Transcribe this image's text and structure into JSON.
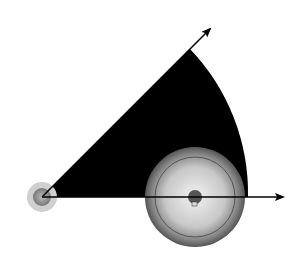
{
  "diagram": {
    "angle_label": "45°",
    "components": {
      "small_sprocket": "drive sprocket",
      "large_sprocket": "driven sprocket",
      "chain": "roller chain",
      "sector": "permissible inclination sector (0° to 45°)",
      "horizontal_axis": "horizontal reference arrow",
      "angle_axis": "45° reference arrow"
    },
    "angle_degrees": 45,
    "colors": {
      "sector": "#000000",
      "chain_plate": "#e6e6e6",
      "sprocket_dark": "#555555",
      "sprocket_light": "#dcdcdc"
    }
  }
}
